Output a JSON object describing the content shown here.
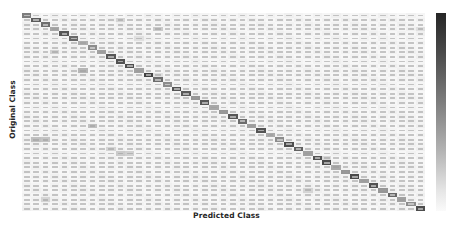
{
  "chart_data": {
    "type": "heatmap",
    "title": "",
    "xlabel": "Predicted Class",
    "ylabel": "Original Class",
    "n_classes": 43,
    "colormap": "Greys",
    "colorbar": true,
    "colorbar_ticks": [],
    "tick_labels_visible": false,
    "cell_text_visible": true,
    "diagonal_intensity": [
      0.62,
      0.78,
      0.7,
      0.42,
      0.8,
      0.72,
      0.38,
      0.55,
      0.45,
      0.8,
      0.82,
      0.84,
      0.45,
      0.9,
      0.7,
      0.55,
      0.82,
      0.78,
      0.5,
      0.8,
      0.42,
      0.5,
      0.8,
      0.7,
      0.45,
      0.82,
      0.4,
      0.55,
      0.85,
      0.75,
      0.45,
      0.82,
      0.86,
      0.4,
      0.5,
      0.86,
      0.45,
      0.82,
      0.5,
      0.72,
      0.45,
      0.55,
      0.85
    ],
    "off_diagonal_highlights": [
      {
        "row": 1,
        "col": 10,
        "intensity": 0.2
      },
      {
        "row": 3,
        "col": 14,
        "intensity": 0.25
      },
      {
        "row": 3,
        "col": 42,
        "intensity": 0.15
      },
      {
        "row": 5,
        "col": 12,
        "intensity": 0.15
      },
      {
        "row": 8,
        "col": 3,
        "intensity": 0.22
      },
      {
        "row": 12,
        "col": 6,
        "intensity": 0.35
      },
      {
        "row": 13,
        "col": 14,
        "intensity": 0.15
      },
      {
        "row": 24,
        "col": 7,
        "intensity": 0.3
      },
      {
        "row": 27,
        "col": 1,
        "intensity": 0.3
      },
      {
        "row": 27,
        "col": 2,
        "intensity": 0.28
      },
      {
        "row": 29,
        "col": 9,
        "intensity": 0.2
      },
      {
        "row": 30,
        "col": 10,
        "intensity": 0.25
      },
      {
        "row": 30,
        "col": 11,
        "intensity": 0.22
      },
      {
        "row": 31,
        "col": 32,
        "intensity": 0.18
      },
      {
        "row": 38,
        "col": 30,
        "intensity": 0.2
      },
      {
        "row": 40,
        "col": 2,
        "intensity": 0.2
      }
    ],
    "background_intensity": 0.06
  },
  "labels": {
    "x_axis": "Predicted Class",
    "y_axis": "Original Class"
  }
}
